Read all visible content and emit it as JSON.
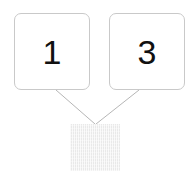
{
  "diagram": {
    "type": "number-bond",
    "background_color": "#ffffff",
    "parts": [
      {
        "id": "left",
        "label": "1",
        "box_fill": "#ffffff",
        "box_border_color": "#c9c9c9",
        "text_color": "#111111"
      },
      {
        "id": "right",
        "label": "3",
        "box_fill": "#ffffff",
        "box_border_color": "#c9c9c9",
        "text_color": "#111111"
      }
    ],
    "whole": {
      "id": "whole",
      "label": "",
      "state": "blank-shaded",
      "fill_color": "#e9e9e9",
      "hatch_color": "#ffffff"
    },
    "connectors": [
      {
        "id": "left-to-whole",
        "from": "part-box-left",
        "to": "whole-box",
        "color": "#b6b6b6",
        "width": 1
      },
      {
        "id": "right-to-whole",
        "from": "part-box-right",
        "to": "whole-box",
        "color": "#b6b6b6",
        "width": 1
      }
    ]
  }
}
